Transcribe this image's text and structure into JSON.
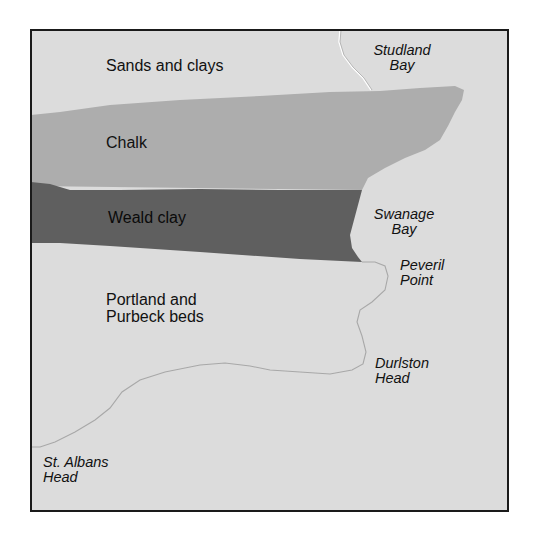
{
  "map": {
    "colors": {
      "background": "#ffffff",
      "land": "#dcdcdc",
      "sands_and_clays": "#dcdcdc",
      "chalk": "#adadad",
      "weald_clay": "#5f5f5f",
      "portland_purbeck": "#dcdcdc",
      "coastline": "#a8a8a8",
      "frame": "#1a1a1a"
    },
    "rock_units": [
      {
        "id": "sands-and-clays",
        "label": "Sands and clays"
      },
      {
        "id": "chalk",
        "label": "Chalk"
      },
      {
        "id": "weald-clay",
        "label": "Weald clay"
      },
      {
        "id": "portland-purbeck",
        "line1": "Portland and",
        "line2": "Purbeck beds"
      }
    ],
    "places": [
      {
        "id": "studland-bay",
        "line1": "Studland",
        "line2": "Bay"
      },
      {
        "id": "swanage-bay",
        "line1": "Swanage",
        "line2": "Bay"
      },
      {
        "id": "peveril-point",
        "line1": "Peveril",
        "line2": "Point"
      },
      {
        "id": "durlston-head",
        "line1": "Durlston",
        "line2": "Head"
      },
      {
        "id": "st-albans-head",
        "line1": "St. Albans",
        "line2": "Head"
      }
    ]
  }
}
